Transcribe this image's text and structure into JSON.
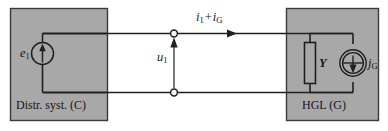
{
  "figure": {
    "type": "circuit-diagram",
    "title": "",
    "background_color": "#ffffff",
    "block_fill_color": "#a8a8a8",
    "line_color": "#202020"
  },
  "blocks": [
    {
      "id": "distribution-system",
      "label": "Distr. syst. (C)",
      "side": "left",
      "contains": [
        "voltage-source-e1"
      ]
    },
    {
      "id": "hgl",
      "label": "HGL (G)",
      "side": "right",
      "contains": [
        "admittance-Y",
        "current-source-jG"
      ]
    }
  ],
  "components": {
    "voltage_source": {
      "symbol": "e",
      "subscript": "1",
      "type": "ideal-voltage-source",
      "arrow_direction": "up"
    },
    "admittance": {
      "symbol": "Y",
      "type": "admittance-box"
    },
    "current_source": {
      "symbol": "j",
      "subscript": "G",
      "type": "ideal-current-source",
      "arrow_direction": "down"
    }
  },
  "annotations": {
    "voltage": {
      "symbol": "u",
      "subscript": "1",
      "arrow_direction": "up"
    },
    "current": {
      "term1_symbol": "i",
      "term1_subscript": "1",
      "operator": "+",
      "term2_symbol": "i",
      "term2_subscript": "G",
      "arrow_direction": "right"
    }
  },
  "terminals": [
    {
      "id": "terminal-top",
      "style": "open-circle"
    },
    {
      "id": "terminal-bottom",
      "style": "open-circle"
    }
  ]
}
